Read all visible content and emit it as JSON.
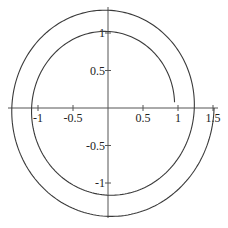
{
  "chart_data": {
    "type": "line",
    "kind": "polar-spiral",
    "title": "",
    "xlabel": "",
    "ylabel": "",
    "equation": {
      "r0": 0.95,
      "k": 0.045,
      "theta_start": 0.08,
      "theta_end": 12.566
    },
    "sample_points": [
      {
        "theta": 0.08,
        "x": 0.96,
        "y": 0.08
      },
      {
        "theta": 1.571,
        "x": 0.0,
        "y": 1.02
      },
      {
        "theta": 3.142,
        "x": -1.09,
        "y": 0.0
      },
      {
        "theta": 4.712,
        "x": 0.0,
        "y": -1.16
      },
      {
        "theta": 6.283,
        "x": 1.23,
        "y": 0.0
      },
      {
        "theta": 7.854,
        "x": 0.0,
        "y": 1.3
      },
      {
        "theta": 9.425,
        "x": -1.37,
        "y": 0.0
      },
      {
        "theta": 10.996,
        "x": 0.0,
        "y": -1.44
      },
      {
        "theta": 12.566,
        "x": 1.52,
        "y": 0.0
      }
    ],
    "xlim": [
      -1.43,
      1.57
    ],
    "ylim": [
      -1.47,
      1.35
    ],
    "x_ticks": [
      {
        "value": -1,
        "label": "-1"
      },
      {
        "value": -0.5,
        "label": "-0.5"
      },
      {
        "value": 0.5,
        "label": "0.5"
      },
      {
        "value": 1,
        "label": "1"
      },
      {
        "value": 1.5,
        "label": "1.5"
      }
    ],
    "y_ticks": [
      {
        "value": 1,
        "label": "1"
      },
      {
        "value": 0.5,
        "label": "0.5"
      },
      {
        "value": -0.5,
        "label": "-0.5"
      },
      {
        "value": -1,
        "label": "-1"
      }
    ],
    "grid": false,
    "legend": null,
    "colors": {
      "curve": "#3a3a3a",
      "axis": "#555555",
      "text": "#222222"
    }
  }
}
